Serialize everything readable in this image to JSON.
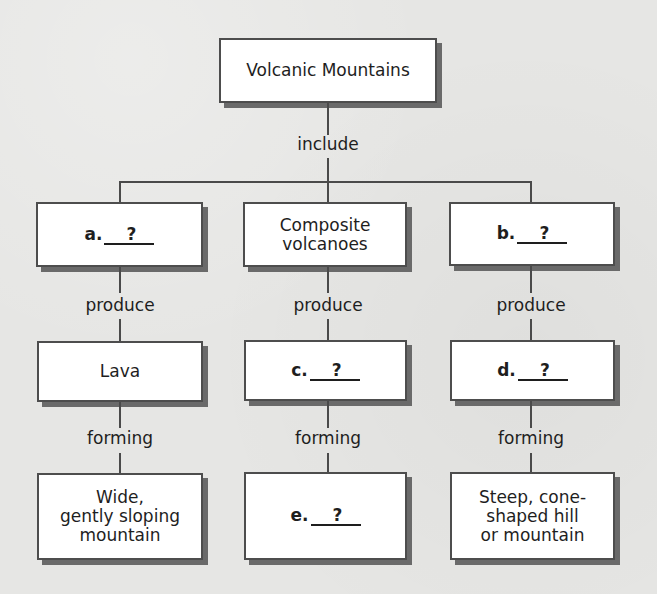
{
  "diagram": {
    "type": "concept-map",
    "root": {
      "label": "Volcanic Mountains"
    },
    "root_link": "include",
    "columns": [
      {
        "type_box": {
          "kind": "blank",
          "letter": "a.",
          "fill": "?"
        },
        "link1": "produce",
        "product_box": {
          "kind": "text",
          "text": "Lava"
        },
        "link2": "forming",
        "result_box": {
          "kind": "text",
          "text": "Wide,\ngently sloping\nmountain"
        }
      },
      {
        "type_box": {
          "kind": "text",
          "text": "Composite\nvolcanoes"
        },
        "link1": "produce",
        "product_box": {
          "kind": "blank",
          "letter": "c.",
          "fill": "?"
        },
        "link2": "forming",
        "result_box": {
          "kind": "blank",
          "letter": "e.",
          "fill": "?"
        }
      },
      {
        "type_box": {
          "kind": "blank",
          "letter": "b.",
          "fill": "?"
        },
        "link1": "produce",
        "product_box": {
          "kind": "blank",
          "letter": "d.",
          "fill": "?"
        },
        "link2": "forming",
        "result_box": {
          "kind": "text",
          "text": "Steep, cone-\nshaped hill\nor mountain"
        }
      }
    ]
  },
  "colors": {
    "background": "#e6e6e4",
    "box_fill": "#ffffff",
    "box_border": "#4d4d4d",
    "box_shadow": "#6a6a6a",
    "connector": "#4a4a4a",
    "text": "#1e1e1e"
  }
}
